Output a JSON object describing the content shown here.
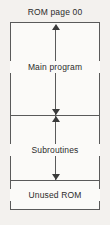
{
  "diagram": {
    "title": "ROM page 00",
    "type": "memory-map",
    "regions": [
      {
        "id": "main-program",
        "label": "Main program"
      },
      {
        "id": "subroutines",
        "label": "Subroutines"
      },
      {
        "id": "unused-rom",
        "label": "Unused ROM"
      }
    ],
    "annotations": {
      "main_span_arrow": "double-headed-vertical-arrow",
      "sub_span_arrow": "double-headed-vertical-arrow"
    },
    "colors": {
      "page_background": "#f3f1ee",
      "box_fill": "#fbfaf8",
      "line": "#5a5a5a",
      "text": "#2b2b2b"
    }
  }
}
